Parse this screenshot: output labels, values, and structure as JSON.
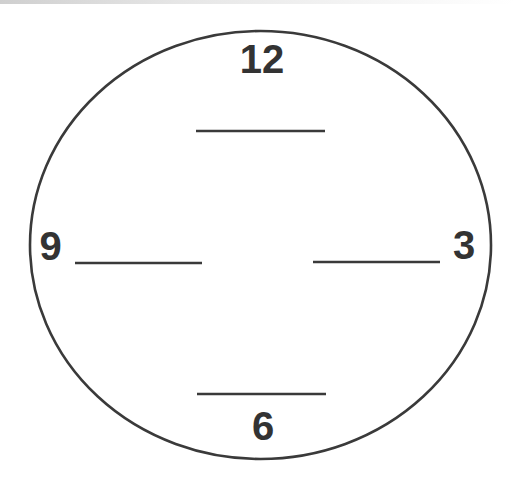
{
  "diagram": {
    "type": "clock-face-worksheet",
    "colors": {
      "stroke": "#3a3a3a",
      "numerals": "#333333",
      "background": "#ffffff"
    },
    "face": {
      "cx": 260.5,
      "cy": 245,
      "rx": 230.5,
      "ry": 214
    },
    "numerals": {
      "twelve": "12",
      "three": "3",
      "six": "6",
      "nine": "9"
    },
    "answer_lines": [
      {
        "position": "top",
        "x1": 196,
        "x2": 325,
        "y": 131
      },
      {
        "position": "left",
        "x1": 75,
        "x2": 202,
        "y": 263
      },
      {
        "position": "right",
        "x1": 313,
        "x2": 440,
        "y": 262
      },
      {
        "position": "bottom",
        "x1": 197,
        "x2": 326,
        "y": 394
      }
    ]
  }
}
